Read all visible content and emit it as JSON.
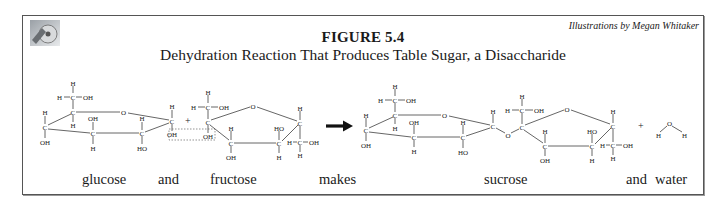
{
  "figure": {
    "number": "FIGURE 5.4",
    "subtitle": "Dehydration Reaction That Produces Table Sugar, a Disaccharide",
    "credit": "Illustrations by Megan Whitaker",
    "logo_icon": "cd-disc-icon"
  },
  "captions": [
    {
      "text": "glucose",
      "x": 82
    },
    {
      "text": "and",
      "x": 158
    },
    {
      "text": "fructose",
      "x": 210
    },
    {
      "text": "makes",
      "x": 319
    },
    {
      "text": "sucrose",
      "x": 484
    },
    {
      "text": "and",
      "x": 626
    },
    {
      "text": "water",
      "x": 655
    }
  ],
  "reaction": {
    "reactants": [
      "glucose",
      "fructose"
    ],
    "products": [
      "sucrose",
      "water"
    ],
    "arrow": "→",
    "plus": "+",
    "removed_group_highlight": "OH + OH (dotted box)",
    "water_atoms": {
      "o": "O",
      "h1": "H",
      "h2": "H"
    }
  },
  "atoms": {
    "C": "C",
    "H": "H",
    "O": "O",
    "OH": "OH",
    "HO": "HO"
  },
  "colors": {
    "frame": "#555555",
    "text": "#1a1a1a",
    "bond": "#555555",
    "arrow": "#111111"
  }
}
